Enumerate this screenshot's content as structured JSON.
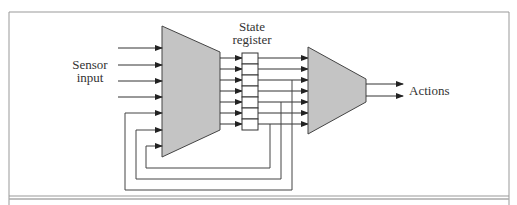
{
  "diagram": {
    "sensor_label_line1": "Sensor",
    "sensor_label_line2": "input",
    "state_label_line1": "State",
    "state_label_line2": "register",
    "actions_label": "Actions",
    "register_cells": 7,
    "sensor_inputs": 4,
    "feedback_inputs": 3,
    "action_outputs": 2,
    "colors": {
      "block_fill": "#c4c4c4",
      "line": "#333333",
      "frame": "#888888"
    }
  }
}
